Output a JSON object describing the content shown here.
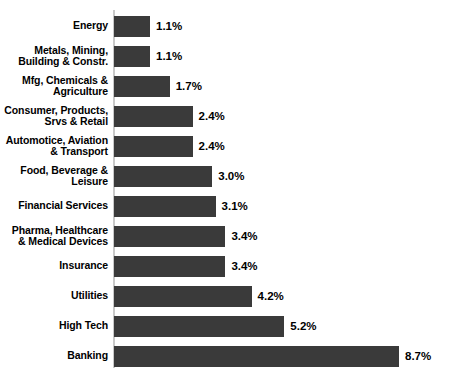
{
  "chart_data": {
    "type": "bar",
    "orientation": "horizontal",
    "title": "",
    "subtitle": "",
    "xlabel": "",
    "ylabel": "",
    "grid": false,
    "legend": false,
    "axis_ticks_visible": false,
    "value_label_suffix": "%",
    "xlim": [
      0,
      8.7
    ],
    "categories": [
      "Energy",
      "Metals, Mining,\nBuilding & Constr.",
      "Mfg, Chemicals &\nAgriculture",
      "Consumer, Products,\nSrvs & Retail",
      "Automotice, Aviation\n& Transport",
      "Food, Beverage &\nLeisure",
      "Financial Services",
      "Pharma, Healthcare\n& Medical Devices",
      "Insurance",
      "Utilities",
      "High Tech",
      "Banking"
    ],
    "values": [
      1.1,
      1.1,
      1.7,
      2.4,
      2.4,
      3.0,
      3.1,
      3.4,
      3.4,
      4.2,
      5.2,
      8.7
    ],
    "value_labels": [
      "1.1%",
      "1.1%",
      "1.7%",
      "2.4%",
      "2.4%",
      "3.0%",
      "3.1%",
      "3.4%",
      "3.4%",
      "4.2%",
      "5.2%",
      "8.7%"
    ],
    "colors": {
      "bar": "#3a3a3a",
      "axis_line": "#c9c9c9",
      "background": "#ffffff",
      "text": "#000000"
    }
  }
}
